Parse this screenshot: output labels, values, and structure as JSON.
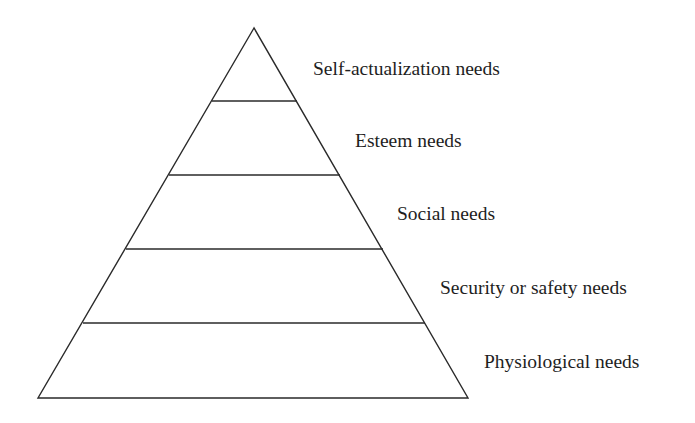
{
  "diagram": {
    "type": "pyramid",
    "title": "",
    "stroke_color": "#2a2a2a",
    "text_color": "#1e1e1e",
    "levels": [
      {
        "order": 5,
        "label": "Self-actualization needs"
      },
      {
        "order": 4,
        "label": "Esteem needs"
      },
      {
        "order": 3,
        "label": "Social needs"
      },
      {
        "order": 2,
        "label": "Security or safety needs"
      },
      {
        "order": 1,
        "label": "Physiological needs"
      }
    ]
  }
}
